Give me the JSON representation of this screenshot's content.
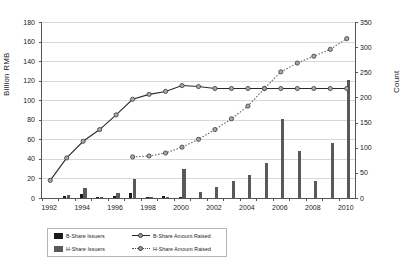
{
  "chart_data": {
    "type": "bar",
    "title": "",
    "xlabel": "",
    "ylabel": "Billion RMB",
    "y2label": "Count",
    "grid": true,
    "legend_position": "bottom-left",
    "x": [
      1992,
      1993,
      1994,
      1995,
      1996,
      1997,
      1998,
      1999,
      2000,
      2001,
      2002,
      2003,
      2004,
      2005,
      2006,
      2007,
      2008,
      2009,
      2010
    ],
    "xtick_labels": [
      "1992",
      "1994",
      "1996",
      "1998",
      "2000",
      "2002",
      "2004",
      "2006",
      "2008",
      "2010"
    ],
    "ylim": [
      0,
      180
    ],
    "yticks": [
      0,
      20,
      40,
      60,
      80,
      100,
      120,
      140,
      160,
      180
    ],
    "y2lim": [
      0,
      350
    ],
    "y2ticks": [
      0,
      50,
      100,
      150,
      200,
      250,
      300,
      350
    ],
    "series": [
      {
        "name": "B-Share Issuers",
        "type": "bar",
        "axis": "right",
        "color": "#1c1c1c",
        "values": [
          0,
          4,
          8,
          2,
          5,
          10,
          1,
          4,
          2,
          0,
          0,
          0,
          0,
          0,
          0,
          0,
          0,
          0,
          0
        ]
      },
      {
        "name": "H-Share Issuers",
        "type": "bar",
        "axis": "right",
        "color": "#595959",
        "values": [
          0,
          6,
          19,
          3,
          9,
          38,
          3,
          3,
          58,
          11,
          22,
          33,
          46,
          70,
          157,
          94,
          33,
          110,
          235
        ]
      },
      {
        "name": "B-Share Amount Raised",
        "type": "line",
        "axis": "left",
        "color": "#2a2a2a",
        "marker": "circle",
        "style": "solid",
        "values": [
          18,
          41,
          58,
          70,
          85,
          101,
          106,
          109,
          115,
          114,
          112,
          112,
          112,
          112,
          112,
          112,
          112,
          112,
          112
        ]
      },
      {
        "name": "H-Share Amount Raised",
        "type": "line",
        "axis": "left",
        "color": "#6a6a6a",
        "marker": "circle",
        "style": "dotted",
        "values": [
          null,
          null,
          null,
          null,
          null,
          42,
          43,
          46,
          52,
          60,
          70,
          81,
          94,
          112,
          129,
          138,
          145,
          152,
          163
        ]
      }
    ]
  },
  "legend": {
    "items": [
      {
        "label": "B-Share Issuers",
        "kind": "bar",
        "tone": "b"
      },
      {
        "label": "B-Share Amount Raised",
        "kind": "line",
        "tone": "solid"
      },
      {
        "label": "H-Share Issuers",
        "kind": "bar",
        "tone": "h"
      },
      {
        "label": "H-Share Amount Raised",
        "kind": "line",
        "tone": "dotted"
      }
    ]
  }
}
